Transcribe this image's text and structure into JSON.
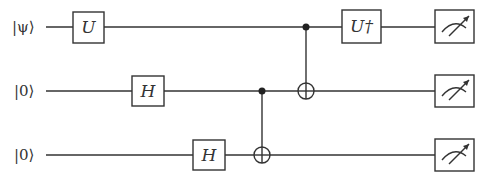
{
  "diagram": {
    "type": "quantum-circuit",
    "qubits": [
      {
        "label": "|ψ⟩",
        "y": 27
      },
      {
        "label": "|0⟩",
        "y": 91
      },
      {
        "label": "|0⟩",
        "y": 155
      }
    ],
    "gates": [
      {
        "name": "U",
        "qubit": 0,
        "x": 73,
        "w": 31
      },
      {
        "name": "H",
        "qubit": 1,
        "x": 132,
        "w": 32
      },
      {
        "name": "H",
        "qubit": 2,
        "x": 193,
        "w": 32
      },
      {
        "name": "U†",
        "qubit": 0,
        "x": 342,
        "w": 39
      }
    ],
    "cnots": [
      {
        "control": 1,
        "target": 2,
        "x": 262
      },
      {
        "control": 0,
        "target": 1,
        "x": 306
      }
    ],
    "measurements": [
      {
        "qubit": 0
      },
      {
        "qubit": 1
      },
      {
        "qubit": 2
      }
    ]
  }
}
